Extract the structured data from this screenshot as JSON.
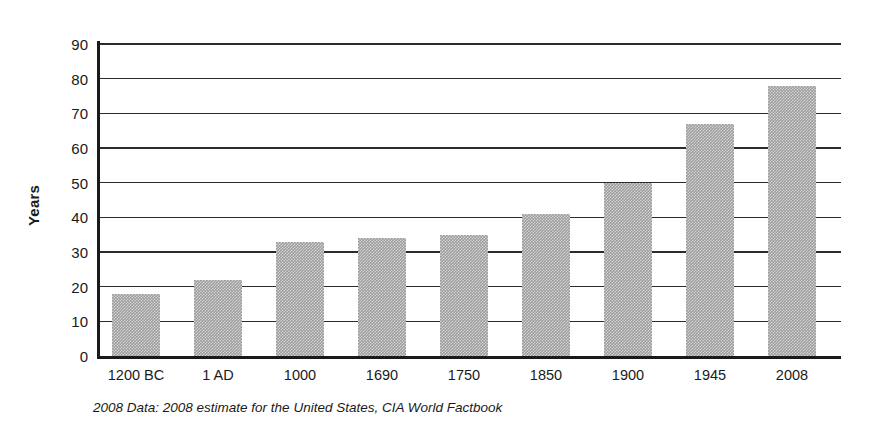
{
  "chart_data": {
    "type": "bar",
    "title": "",
    "xlabel": "",
    "ylabel": "Years",
    "categories": [
      "1200 BC",
      "1 AD",
      "1000",
      "1690",
      "1750",
      "1850",
      "1900",
      "1945",
      "2008"
    ],
    "values": [
      18,
      22,
      33,
      34,
      35,
      41,
      50,
      67,
      78
    ],
    "ylim": [
      0,
      90
    ],
    "ytick_labels": [
      "90",
      "80",
      "70",
      "60",
      "50",
      "40",
      "30",
      "20",
      "10",
      "0"
    ],
    "ytick_values": [
      90,
      80,
      70,
      60,
      50,
      40,
      30,
      20,
      10,
      0
    ],
    "grid": true,
    "legend": "none",
    "bar_color": "#9c9c9c",
    "axis_color": "#1a1a1a",
    "footnote": "2008 Data: 2008 estimate for the United States, CIA World Factbook"
  }
}
